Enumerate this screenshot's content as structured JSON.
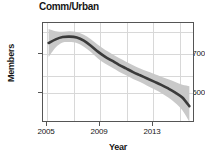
{
  "chart_data": {
    "type": "line",
    "title": "Comm/Urban",
    "xlabel": "Year",
    "ylabel": "Members",
    "grid": true,
    "legend": "none",
    "xlim": [
      2004.6,
      2015.4
    ],
    "ylim": [
      555,
      775
    ],
    "xticks": [
      2005,
      2009,
      2013
    ],
    "xtick_labels": [
      "2005",
      "2009",
      "2013"
    ],
    "yticks": [
      600,
      700
    ],
    "ytick_labels": [
      "600",
      "700"
    ],
    "x_gridlines": [
      2005,
      2007,
      2009,
      2011,
      2013,
      2015
    ],
    "y_gridlines": [
      600,
      650,
      700,
      750
    ],
    "series": [
      {
        "name": "Comm/Urban trend",
        "color": "#3a3a3a",
        "x": [
          2005,
          2005.5,
          2006,
          2006.5,
          2007,
          2007.5,
          2008,
          2008.5,
          2009,
          2009.5,
          2010,
          2010.5,
          2011,
          2011.5,
          2012,
          2012.5,
          2013,
          2013.5,
          2014,
          2014.5,
          2015
        ],
        "values": [
          731,
          739,
          744,
          745,
          743,
          736,
          725,
          712,
          701,
          692,
          683,
          675,
          667,
          660,
          653,
          646,
          639,
          631,
          622,
          611,
          592
        ]
      }
    ],
    "confidence_band": {
      "name": "confidence interval",
      "color": "#c8c8c8",
      "x": [
        2005,
        2005.5,
        2006,
        2006.5,
        2007,
        2007.5,
        2008,
        2008.5,
        2009,
        2009.5,
        2010,
        2010.5,
        2011,
        2011.5,
        2012,
        2012.5,
        2013,
        2013.5,
        2014,
        2014.5,
        2015
      ],
      "upper": [
        762,
        757,
        756,
        757,
        755,
        749,
        739,
        727,
        716,
        707,
        698,
        690,
        682,
        675,
        669,
        663,
        657,
        651,
        645,
        639,
        636
      ],
      "lower": [
        700,
        721,
        732,
        733,
        731,
        723,
        711,
        697,
        686,
        677,
        668,
        660,
        652,
        645,
        637,
        629,
        621,
        611,
        599,
        583,
        558
      ]
    }
  }
}
